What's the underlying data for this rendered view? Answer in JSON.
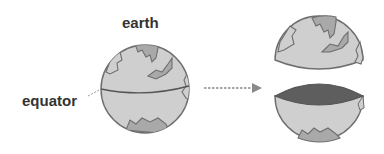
{
  "diagram": {
    "labels": {
      "earth": "earth",
      "equator": "equator"
    },
    "colors": {
      "ocean": "#cfcfcf",
      "land": "#a9a9a9",
      "outline": "#6e6e6e",
      "cut_face": "#5e5e5e",
      "arrow": "#8a8a8a",
      "text": "#333333"
    },
    "parts": [
      "whole globe",
      "northern hemisphere",
      "southern hemisphere"
    ]
  }
}
